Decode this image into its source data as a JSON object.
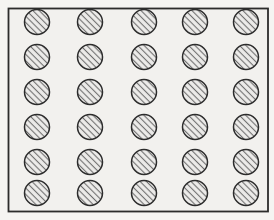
{
  "figure": {
    "canvas": {
      "width": 274,
      "height": 220
    },
    "background_color": "#f5f4f2",
    "frame": {
      "x": 8.5,
      "y": 8.5,
      "width": 259.5,
      "height": 203,
      "fill_color": "#f2f1ee",
      "border_color": "#2c2c2c",
      "border_width": 1.8
    },
    "circles": {
      "rows": 6,
      "columns": 5,
      "count": 30,
      "column_centers_x": [
        37,
        90,
        144,
        195,
        246
      ],
      "row_centers_y": [
        22,
        57,
        92,
        127,
        162,
        193
      ],
      "radius": 12.5,
      "outline_color": "#2c2c2c",
      "outline_width": 1.5,
      "fill_color": "#edecea",
      "hatch": {
        "direction": "backslash",
        "angle_deg": 45,
        "spacing": 4.5,
        "line_color": "#6e6e6e",
        "line_width": 1.1
      }
    }
  }
}
